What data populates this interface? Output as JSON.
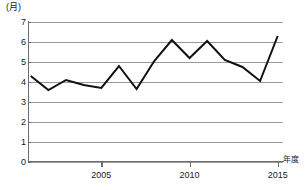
{
  "chart_data": {
    "type": "line",
    "title": "",
    "ylabel": "(月)",
    "xlabel": "年度",
    "ylim": [
      0,
      7
    ],
    "xlim": [
      2000.9,
      2015.3
    ],
    "grid": true,
    "legend": false,
    "yticks": [
      7,
      6,
      5,
      4,
      3,
      2,
      1,
      0
    ],
    "ytick_labels": [
      "7",
      "6",
      "5",
      "4",
      "3",
      "2",
      "1",
      "0"
    ],
    "xticks": [
      2005,
      2010,
      2015
    ],
    "xtick_labels": [
      "2005",
      "2010",
      "2015"
    ],
    "x": [
      2001,
      2002,
      2003,
      2004,
      2005,
      2006,
      2007,
      2008,
      2009,
      2010,
      2011,
      2012,
      2013,
      2014,
      2015
    ],
    "values": [
      4.3,
      3.6,
      4.1,
      3.85,
      3.7,
      4.8,
      3.65,
      5.05,
      6.1,
      5.2,
      6.05,
      5.1,
      4.75,
      4.05,
      6.3
    ],
    "series": [
      {
        "name": "",
        "color": "#111111",
        "values": [
          4.3,
          3.6,
          4.1,
          3.85,
          3.7,
          4.8,
          3.65,
          5.05,
          6.1,
          5.2,
          6.05,
          5.1,
          4.75,
          4.05,
          6.3
        ]
      }
    ],
    "colors": {
      "line": "#111111",
      "grid": "#9a9a9a",
      "axis": "#6e6e6e",
      "text": "#1a1a1a",
      "background": "#ffffff"
    }
  }
}
